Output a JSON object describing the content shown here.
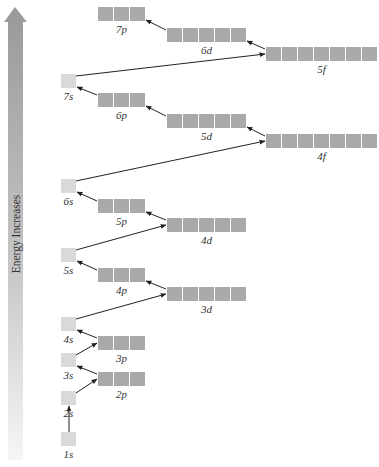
{
  "axis": {
    "label": "Energy Increases",
    "direction": "up"
  },
  "colors": {
    "s_orbital": "#d9d9d9",
    "pdf_orbital": "#a9a9a9",
    "arrow_top": "#999999",
    "arrow_bottom": "#f4f4f4",
    "line": "#222222"
  },
  "orbitals": [
    {
      "name": "1s",
      "boxes": 1,
      "x": 61,
      "y": 432
    },
    {
      "name": "2s",
      "boxes": 1,
      "x": 61,
      "y": 391
    },
    {
      "name": "2p",
      "boxes": 3,
      "x": 98,
      "y": 372
    },
    {
      "name": "3s",
      "boxes": 1,
      "x": 61,
      "y": 353
    },
    {
      "name": "3p",
      "boxes": 3,
      "x": 98,
      "y": 336
    },
    {
      "name": "4s",
      "boxes": 1,
      "x": 61,
      "y": 317
    },
    {
      "name": "3d",
      "boxes": 5,
      "x": 167,
      "y": 287
    },
    {
      "name": "4p",
      "boxes": 3,
      "x": 98,
      "y": 268
    },
    {
      "name": "5s",
      "boxes": 1,
      "x": 61,
      "y": 248
    },
    {
      "name": "4d",
      "boxes": 5,
      "x": 167,
      "y": 218
    },
    {
      "name": "5p",
      "boxes": 3,
      "x": 98,
      "y": 199
    },
    {
      "name": "6s",
      "boxes": 1,
      "x": 61,
      "y": 179
    },
    {
      "name": "4f",
      "boxes": 7,
      "x": 266,
      "y": 134
    },
    {
      "name": "5d",
      "boxes": 5,
      "x": 167,
      "y": 114
    },
    {
      "name": "6p",
      "boxes": 3,
      "x": 98,
      "y": 93
    },
    {
      "name": "7s",
      "boxes": 1,
      "x": 61,
      "y": 74
    },
    {
      "name": "5f",
      "boxes": 7,
      "x": 266,
      "y": 47
    },
    {
      "name": "6d",
      "boxes": 5,
      "x": 167,
      "y": 28
    },
    {
      "name": "7p",
      "boxes": 3,
      "x": 98,
      "y": 7
    }
  ],
  "filling_order": [
    "1s",
    "2s",
    "2p",
    "3s",
    "3p",
    "4s",
    "3d",
    "4p",
    "5s",
    "4d",
    "5p",
    "6s",
    "4f",
    "5d",
    "6p",
    "7s",
    "5f",
    "6d",
    "7p"
  ]
}
